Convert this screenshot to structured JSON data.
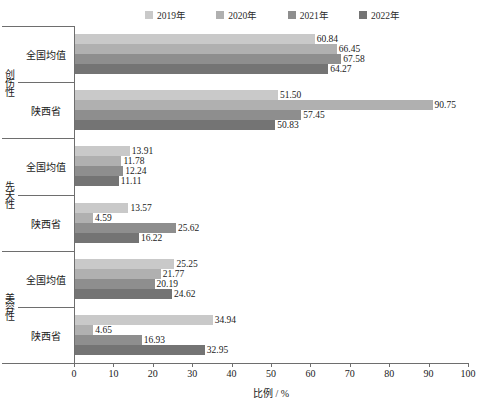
{
  "chart_data": {
    "type": "bar",
    "orientation": "horizontal",
    "title": "",
    "xlabel": "比例 / %",
    "ylabel": "",
    "xlim": [
      0,
      100
    ],
    "xticks": [
      0,
      10,
      20,
      30,
      40,
      50,
      60,
      70,
      80,
      90,
      100
    ],
    "grid": false,
    "legend_position": "top",
    "legend": [
      "2019年",
      "2020年",
      "2021年",
      "2022年"
    ],
    "series": [
      {
        "name": "2019年",
        "color": "#c9c9c9"
      },
      {
        "name": "2020年",
        "color": "#b0b0b0"
      },
      {
        "name": "2021年",
        "color": "#8e8e8e"
      },
      {
        "name": "2022年",
        "color": "#747474"
      }
    ],
    "groups": [
      {
        "label": "创伤性",
        "subgroups": [
          {
            "label": "全国均值",
            "values": [
              60.84,
              66.45,
              67.58,
              64.27
            ]
          },
          {
            "label": "陕西省",
            "values": [
              51.5,
              90.75,
              57.45,
              50.83
            ]
          }
        ]
      },
      {
        "label": "先天性",
        "subgroups": [
          {
            "label": "全国均值",
            "values": [
              13.91,
              11.78,
              12.24,
              11.11
            ]
          },
          {
            "label": "陕西省",
            "values": [
              13.57,
              4.59,
              25.62,
              16.22
            ]
          }
        ]
      },
      {
        "label": "美容性",
        "subgroups": [
          {
            "label": "全国均值",
            "values": [
              25.25,
              21.77,
              20.19,
              24.62
            ]
          },
          {
            "label": "陕西省",
            "values": [
              34.94,
              4.65,
              16.93,
              32.95
            ]
          }
        ]
      }
    ]
  }
}
